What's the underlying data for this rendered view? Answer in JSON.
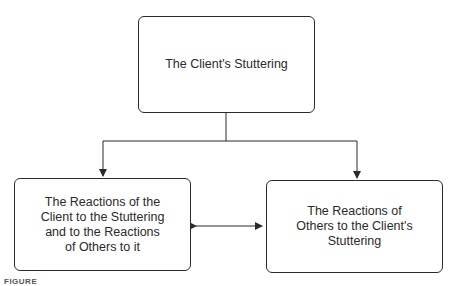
{
  "diagram": {
    "nodes": [
      {
        "id": "top",
        "label": "The Client's Stuttering"
      },
      {
        "id": "left",
        "label": "The Reactions of the Client to the Stuttering and to the Reactions of Others to it"
      },
      {
        "id": "right",
        "label": "The Reactions of Others to the Client's Stuttering"
      }
    ],
    "edges": [
      {
        "from": "top",
        "to": "left",
        "type": "arrow"
      },
      {
        "from": "top",
        "to": "right",
        "type": "arrow"
      },
      {
        "from": "left",
        "to": "right",
        "type": "double-arrow"
      }
    ],
    "caption": "FIGURE"
  },
  "colors": {
    "line": "#2b2b2b",
    "background": "#ffffff"
  }
}
